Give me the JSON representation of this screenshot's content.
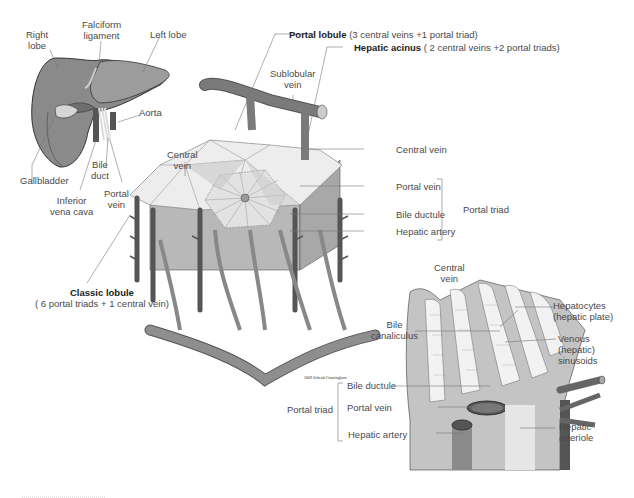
{
  "liver": {
    "right_lobe": [
      "Right",
      "lobe"
    ],
    "falciform": [
      "Falciform",
      "ligament"
    ],
    "left_lobe": "Left lobe",
    "aorta": "Aorta",
    "gallbladder": "Gallbladder",
    "bile_duct": [
      "Bile",
      "duct"
    ],
    "inferior_vena_cava": [
      "Inferior",
      "vena cava"
    ],
    "portal_vein": [
      "Portal",
      "vein"
    ]
  },
  "lobule": {
    "central_vein_top": [
      "Central",
      "vein"
    ],
    "sublobular_vein": [
      "Sublobular",
      "vein"
    ],
    "portal_lobule": {
      "bold": "Portal lobule",
      "rest": " (3 central veins +1 portal triad)"
    },
    "hepatic_acinus": {
      "bold": "Hepatic acinus",
      "rest": " ( 2 central veins +2 portal triads)"
    },
    "central_vein_right": "Central vein",
    "portal_vein": "Portal vein",
    "bile_ductule": "Bile ductule",
    "hepatic_artery": "Hepatic artery",
    "portal_triad": "Portal triad",
    "classic_lobule": {
      "bold": "Classic lobule",
      "rest": "( 6 portal triads + 1 central vein)"
    }
  },
  "detail": {
    "central_vein": [
      "Central",
      "vein"
    ],
    "hepatocytes": [
      "Hepatocytes",
      "(hepatic plate)"
    ],
    "bile_canaliculus": [
      "Bile",
      "canaliculus"
    ],
    "sinusoids": [
      "Venous",
      "(hepatic)",
      "sinusoids"
    ],
    "credit": "2009 Schenk/Cunningham",
    "bile_ductule": "Bile ductule",
    "portal_vein": "Portal vein",
    "hepatic_artery": "Hepatic artery",
    "portal_triad": "Portal triad",
    "hepatic_arteriole": [
      "Hepatic",
      "arteriole"
    ]
  },
  "colors": {
    "organ_dark": "#7a7a7a",
    "organ_mid": "#9a9a9a",
    "organ_light": "#d8d8d8",
    "vessel": "#6e6e6e",
    "leader": "#777777"
  }
}
